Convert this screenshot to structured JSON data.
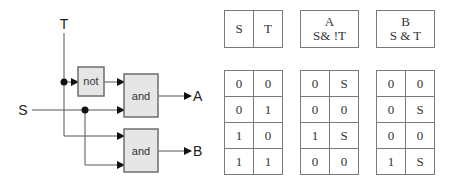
{
  "circuit": {
    "inputs": {
      "t": "T",
      "s": "S"
    },
    "outputs": {
      "a": "A",
      "b": "B"
    },
    "gates": {
      "not": "not",
      "and_a": "and",
      "and_b": "and"
    },
    "colors": {
      "gate_fill": "#e6e6e6",
      "gate_stroke": "#6e6e6e",
      "wire": "#555555"
    }
  },
  "tables": {
    "inputs": {
      "headers": [
        "S",
        "T"
      ],
      "rows": [
        [
          "0",
          "0"
        ],
        [
          "0",
          "1"
        ],
        [
          "1",
          "0"
        ],
        [
          "1",
          "1"
        ]
      ]
    },
    "a": {
      "title": "A",
      "expr": "S& !T",
      "rows": [
        [
          "0",
          "S"
        ],
        [
          "0",
          "0"
        ],
        [
          "1",
          "S"
        ],
        [
          "0",
          "0"
        ]
      ]
    },
    "b": {
      "title": "B",
      "expr": "S & T",
      "rows": [
        [
          "0",
          "0"
        ],
        [
          "0",
          "S"
        ],
        [
          "0",
          "0"
        ],
        [
          "1",
          "S"
        ]
      ]
    }
  }
}
